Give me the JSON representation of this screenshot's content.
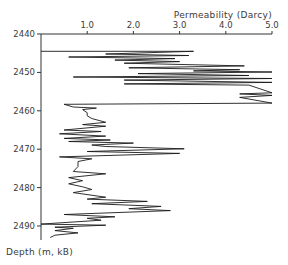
{
  "chart_data": {
    "type": "line",
    "title": "Permeability (Darcy)",
    "xlabel": "Permeability (Darcy)",
    "ylabel": "Depth (m, kB)",
    "x_axis_position": "top",
    "xlim": [
      0,
      5.0
    ],
    "ylim": [
      2440,
      2494
    ],
    "y_inverted": true,
    "grid": false,
    "x_ticks": [
      "1.0",
      "2.0",
      "3.0",
      "4.0",
      "5.0"
    ],
    "y_ticks": [
      "2440",
      "2450",
      "2460",
      "2470",
      "2480",
      "2490"
    ],
    "series": [
      {
        "name": "Permeability log",
        "points": [
          [
            0.0,
            2444.5
          ],
          [
            3.3,
            2444.5
          ],
          [
            1.4,
            2445.2
          ],
          [
            3.2,
            2445.6
          ],
          [
            0.6,
            2446.0
          ],
          [
            2.9,
            2446.4
          ],
          [
            1.6,
            2446.8
          ],
          [
            3.0,
            2447.2
          ],
          [
            1.8,
            2447.6
          ],
          [
            4.4,
            2448.3
          ],
          [
            1.9,
            2448.8
          ],
          [
            4.3,
            2449.3
          ],
          [
            3.3,
            2449.6
          ],
          [
            5.0,
            2449.9
          ],
          [
            2.1,
            2450.3
          ],
          [
            4.5,
            2450.8
          ],
          [
            0.7,
            2451.2
          ],
          [
            5.0,
            2451.6
          ],
          [
            1.8,
            2452.0
          ],
          [
            5.0,
            2452.6
          ],
          [
            1.8,
            2453.0
          ],
          [
            4.5,
            2453.3
          ],
          [
            5.0,
            2455.3
          ],
          [
            4.3,
            2455.6
          ],
          [
            5.0,
            2456.0
          ],
          [
            4.3,
            2456.5
          ],
          [
            5.0,
            2458.0
          ],
          [
            0.5,
            2458.3
          ],
          [
            0.7,
            2459.0
          ],
          [
            1.2,
            2459.3
          ],
          [
            0.9,
            2459.7
          ],
          [
            1.0,
            2460.5
          ],
          [
            1.0,
            2461.3
          ],
          [
            1.1,
            2462.0
          ],
          [
            1.4,
            2463.0
          ],
          [
            0.9,
            2463.6
          ],
          [
            1.4,
            2464.0
          ],
          [
            0.5,
            2465.0
          ],
          [
            1.3,
            2465.4
          ],
          [
            0.4,
            2466.0
          ],
          [
            1.4,
            2466.6
          ],
          [
            0.5,
            2467.2
          ],
          [
            1.5,
            2467.6
          ],
          [
            0.6,
            2468.0
          ],
          [
            2.0,
            2468.4
          ],
          [
            1.1,
            2468.9
          ],
          [
            1.4,
            2469.3
          ],
          [
            3.1,
            2469.9
          ],
          [
            1.0,
            2470.6
          ],
          [
            3.0,
            2471.1
          ],
          [
            0.4,
            2472.0
          ],
          [
            1.1,
            2472.5
          ],
          [
            0.8,
            2473.2
          ],
          [
            0.8,
            2474.5
          ],
          [
            0.7,
            2475.8
          ],
          [
            1.4,
            2476.4
          ],
          [
            0.6,
            2477.4
          ],
          [
            0.9,
            2478.2
          ],
          [
            0.6,
            2479.0
          ],
          [
            0.9,
            2479.8
          ],
          [
            1.1,
            2480.5
          ],
          [
            0.7,
            2481.3
          ],
          [
            1.4,
            2482.5
          ],
          [
            1.0,
            2483.0
          ],
          [
            2.3,
            2483.6
          ],
          [
            1.1,
            2484.2
          ],
          [
            2.6,
            2484.9
          ],
          [
            1.9,
            2485.5
          ],
          [
            2.8,
            2486.0
          ],
          [
            0.5,
            2487.0
          ],
          [
            1.6,
            2487.6
          ],
          [
            1.0,
            2488.0
          ],
          [
            1.3,
            2488.5
          ],
          [
            0.0,
            2489.5
          ],
          [
            1.4,
            2489.8
          ],
          [
            0.3,
            2490.3
          ],
          [
            0.7,
            2490.6
          ],
          [
            0.3,
            2491.2
          ],
          [
            0.8,
            2491.8
          ],
          [
            0.3,
            2492.4
          ],
          [
            0.2,
            2493.0
          ]
        ]
      }
    ]
  }
}
